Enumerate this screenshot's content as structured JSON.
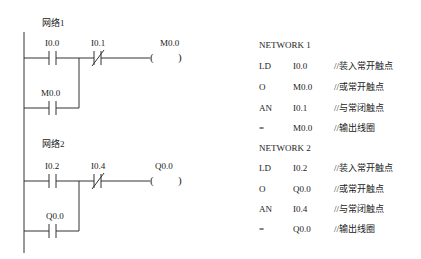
{
  "ladder": {
    "networks": [
      {
        "title": "网络1",
        "contact_no": "I0.0",
        "contact_nc": "I0.1",
        "coil": "M0.0",
        "parallel_contact": "M0.0",
        "coil_open": "(",
        "coil_close": ")"
      },
      {
        "title": "网络2",
        "contact_no": "I0.2",
        "contact_nc": "I0.4",
        "coil": "Q0.0",
        "parallel_contact": "Q0.0",
        "coil_open": "(",
        "coil_close": ")"
      }
    ]
  },
  "stl": {
    "networks": [
      {
        "header": "NETWORK 1",
        "rows": [
          {
            "op": "LD",
            "operand": "I0.0",
            "comment": "//装入常开触点"
          },
          {
            "op": "O",
            "operand": "M0.0",
            "comment": "//或常开触点"
          },
          {
            "op": "AN",
            "operand": "I0.1",
            "comment": "//与常闭触点"
          },
          {
            "op": "=",
            "operand": "M0.0",
            "comment": "//输出线圈"
          }
        ]
      },
      {
        "header": "NETWORK 2",
        "rows": [
          {
            "op": "LD",
            "operand": "I0.2",
            "comment": "//装入常开触点"
          },
          {
            "op": "O",
            "operand": "Q0.0",
            "comment": "//或常开触点"
          },
          {
            "op": "AN",
            "operand": "I0.4",
            "comment": "//与常闭触点"
          },
          {
            "op": "=",
            "operand": "Q0.0",
            "comment": "//输出线圈"
          }
        ]
      }
    ]
  }
}
